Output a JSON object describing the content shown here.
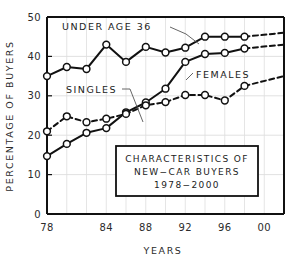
{
  "chart_data": {
    "type": "line",
    "title_lines": [
      "CHARACTERISTICS OF",
      "NEW−CAR BUYERS",
      "1978−2000"
    ],
    "xlabel": "YEARS",
    "ylabel": "PERCENTAGE OF BUYERS",
    "xlim": [
      78,
      102
    ],
    "ylim": [
      0,
      50
    ],
    "yticks": [
      0,
      10,
      20,
      30,
      40,
      50
    ],
    "ytick_labels": [
      "0",
      "10",
      "20",
      "30",
      "40",
      "50"
    ],
    "xticks": [
      78,
      84,
      88,
      92,
      96,
      100
    ],
    "xtick_labels": [
      "78",
      "84",
      "88",
      "92",
      "96",
      "00"
    ],
    "x_gridlines": [
      80,
      82,
      84,
      86,
      88,
      90,
      92,
      94,
      96,
      98,
      100
    ],
    "grid": true,
    "legend_position": "inline-annotations",
    "x": [
      78,
      80,
      82,
      84,
      86,
      88,
      90,
      92,
      94,
      96,
      98
    ],
    "series": [
      {
        "name": "UNDER AGE 36",
        "style": "solid",
        "marker": "circle",
        "values": [
          35,
          37.3,
          36.8,
          43,
          38.6,
          42.4,
          41,
          42.2,
          45,
          45,
          45
        ],
        "projection": {
          "style": "dashed",
          "x": [
            98,
            102
          ],
          "values": [
            45,
            46
          ]
        }
      },
      {
        "name": "FEMALES",
        "style": "solid",
        "marker": "circle",
        "values": [
          14.7,
          17.8,
          20.6,
          21.8,
          25.8,
          28.3,
          31.8,
          38.6,
          40.6,
          40.9,
          42
        ],
        "projection": {
          "style": "dashed",
          "x": [
            98,
            102
          ],
          "values": [
            42,
            43
          ]
        }
      },
      {
        "name": "SINGLES",
        "style": "dashed",
        "marker": "circle",
        "values": [
          21,
          24.8,
          23.3,
          24.2,
          25.4,
          27.6,
          28.4,
          30.2,
          30.2,
          28.8,
          32.5
        ],
        "projection": {
          "style": "dashed",
          "x": [
            98,
            102
          ],
          "values": [
            32.5,
            35
          ]
        }
      }
    ],
    "annotations": [
      {
        "name": "under-age-36",
        "text": "UNDER AGE 36",
        "has_leader": true
      },
      {
        "name": "singles",
        "text": "SINGLES",
        "has_leader": true
      },
      {
        "name": "females",
        "text": "FEMALES",
        "has_leader": true
      }
    ]
  }
}
